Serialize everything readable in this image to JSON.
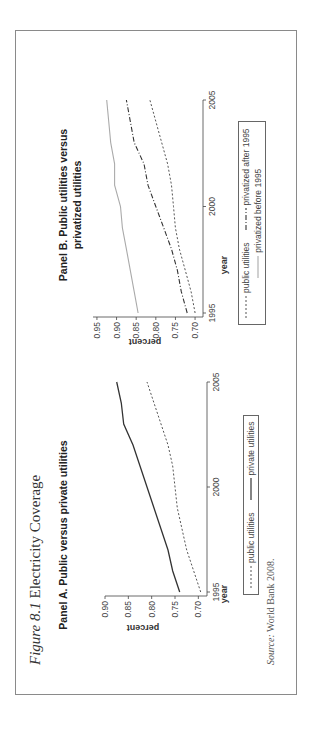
{
  "figure": {
    "caption_label": "Figure 8.1",
    "caption_title": "Electricity Coverage",
    "source_label": "Source:",
    "source_text": "World Bank 2008."
  },
  "panel_a": {
    "title": "Panel A. Public versus private utilities",
    "ylabel": "percent",
    "xlabel": "year",
    "yticks": [
      "0.70",
      "0.75",
      "0.80",
      "0.85",
      "0.90"
    ],
    "xticks": [
      "1995",
      "2000",
      "2005"
    ],
    "legend": [
      "public utilities",
      "private utilities"
    ]
  },
  "panel_b": {
    "title_line1": "Panel B. Public utilities versus",
    "title_line2": "privatized utilities",
    "ylabel": "percent",
    "xlabel": "year",
    "yticks": [
      "0.70",
      "0.75",
      "0.80",
      "0.85",
      "0.90",
      "0.95"
    ],
    "xticks": [
      "1995",
      "2000",
      "2005"
    ],
    "legend": [
      "public utilities",
      "privatized after 1995",
      "privatized before 1995"
    ]
  },
  "chart_data": [
    {
      "type": "line",
      "title": "Panel A. Public versus private utilities",
      "xlabel": "year",
      "ylabel": "percent",
      "x": [
        1995,
        1996,
        1997,
        1998,
        1999,
        2000,
        2001,
        2002,
        2003,
        2004,
        2005
      ],
      "xlim": [
        1995,
        2005
      ],
      "ylim": [
        0.69,
        0.9
      ],
      "legend_position": "bottom",
      "grid": false,
      "series": [
        {
          "name": "public utilities",
          "style": "dotted",
          "values": [
            0.695,
            0.71,
            0.725,
            0.735,
            0.745,
            0.75,
            0.755,
            0.765,
            0.78,
            0.795,
            0.81
          ]
        },
        {
          "name": "private utilities",
          "style": "solid",
          "values": [
            0.74,
            0.755,
            0.765,
            0.78,
            0.795,
            0.81,
            0.825,
            0.84,
            0.86,
            0.865,
            0.875
          ]
        }
      ]
    },
    {
      "type": "line",
      "title": "Panel B. Public utilities versus privatized utilities",
      "xlabel": "year",
      "ylabel": "percent",
      "x": [
        1995,
        1996,
        1997,
        1998,
        1999,
        2000,
        2001,
        2002,
        2003,
        2004,
        2005
      ],
      "xlim": [
        1995,
        2005
      ],
      "ylim": [
        0.69,
        0.96
      ],
      "legend_position": "bottom",
      "grid": false,
      "series": [
        {
          "name": "public utilities",
          "style": "dotted",
          "values": [
            0.7,
            0.71,
            0.725,
            0.74,
            0.75,
            0.755,
            0.76,
            0.77,
            0.785,
            0.8,
            0.815
          ]
        },
        {
          "name": "privatized after 1995",
          "style": "dash-dot",
          "values": [
            0.72,
            0.735,
            0.745,
            0.76,
            0.78,
            0.8,
            0.82,
            0.83,
            0.855,
            0.865,
            0.875
          ]
        },
        {
          "name": "privatized before 1995",
          "style": "solid-gray",
          "values": [
            0.845,
            0.855,
            0.865,
            0.875,
            0.885,
            0.89,
            0.905,
            0.905,
            0.915,
            0.92,
            0.925
          ]
        }
      ]
    }
  ]
}
